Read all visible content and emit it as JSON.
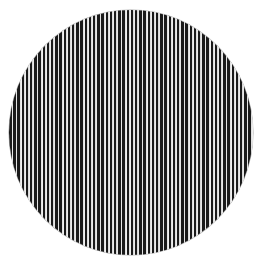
{
  "image": {
    "subject": "circular disc filled with vertical black and white stripes",
    "shape": "circle",
    "pattern": "vertical-stripes",
    "colors": {
      "background": "#ffffff",
      "stripe_dark": "#1a1a1a",
      "stripe_light": "#f2f2f2"
    },
    "geometry": {
      "center_x": 131,
      "center_y": 132,
      "radius": 122,
      "stripe_period_px": 4.2
    }
  }
}
